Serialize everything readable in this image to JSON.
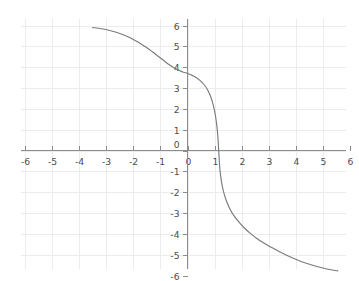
{
  "chart_data": {
    "type": "line",
    "title": "",
    "subtitle": "",
    "xlabel": "",
    "ylabel": "",
    "xlim": [
      -6,
      6
    ],
    "ylim": [
      -6,
      6
    ],
    "grid": true,
    "legend": false,
    "legend_position": "none",
    "x_ticks": [
      -6,
      -5,
      -4,
      -3,
      -2,
      -1,
      0,
      1,
      2,
      3,
      4,
      5,
      6
    ],
    "y_ticks": [
      -6,
      -5,
      -4,
      -3,
      -2,
      -1,
      0,
      1,
      2,
      3,
      4,
      5,
      6
    ],
    "x_tick_labels": [
      "-6",
      "-5",
      "-4",
      "-3",
      "-2",
      "-1",
      "0",
      "1",
      "2",
      "3",
      "4",
      "5",
      "6"
    ],
    "y_tick_labels": [
      "-6",
      "-5",
      "-4",
      "-3",
      "-2",
      "-1",
      "0",
      "1",
      "2",
      "3",
      "4",
      "5",
      "6"
    ],
    "annotations": [],
    "series": [
      {
        "name": "curve",
        "color": "#7a7a7a",
        "x_zero_crossing": 1.15,
        "y_at_x_zero": 3.7,
        "points": [
          [
            -3.5,
            5.9
          ],
          [
            -3.3,
            5.87
          ],
          [
            -3.1,
            5.83
          ],
          [
            -2.9,
            5.77
          ],
          [
            -2.7,
            5.7
          ],
          [
            -2.5,
            5.62
          ],
          [
            -2.3,
            5.52
          ],
          [
            -2.1,
            5.4
          ],
          [
            -1.9,
            5.26
          ],
          [
            -1.7,
            5.1
          ],
          [
            -1.5,
            4.93
          ],
          [
            -1.3,
            4.74
          ],
          [
            -1.1,
            4.54
          ],
          [
            -0.9,
            4.34
          ],
          [
            -0.7,
            4.14
          ],
          [
            -0.5,
            3.97
          ],
          [
            -0.3,
            3.84
          ],
          [
            -0.15,
            3.76
          ],
          [
            0.0,
            3.7
          ],
          [
            0.15,
            3.62
          ],
          [
            0.3,
            3.52
          ],
          [
            0.45,
            3.38
          ],
          [
            0.6,
            3.18
          ],
          [
            0.72,
            2.96
          ],
          [
            0.82,
            2.7
          ],
          [
            0.9,
            2.42
          ],
          [
            0.97,
            2.08
          ],
          [
            1.03,
            1.68
          ],
          [
            1.08,
            1.22
          ],
          [
            1.12,
            0.7
          ],
          [
            1.15,
            0.05
          ],
          [
            1.18,
            -0.62
          ],
          [
            1.22,
            -1.18
          ],
          [
            1.28,
            -1.68
          ],
          [
            1.36,
            -2.12
          ],
          [
            1.46,
            -2.5
          ],
          [
            1.58,
            -2.84
          ],
          [
            1.72,
            -3.14
          ],
          [
            1.9,
            -3.44
          ],
          [
            2.1,
            -3.72
          ],
          [
            2.32,
            -3.98
          ],
          [
            2.56,
            -4.22
          ],
          [
            2.82,
            -4.44
          ],
          [
            3.1,
            -4.65
          ],
          [
            3.4,
            -4.86
          ],
          [
            3.72,
            -5.06
          ],
          [
            4.04,
            -5.24
          ],
          [
            4.36,
            -5.4
          ],
          [
            4.68,
            -5.53
          ],
          [
            5.0,
            -5.64
          ],
          [
            5.2,
            -5.7
          ],
          [
            5.4,
            -5.75
          ],
          [
            5.55,
            -5.78
          ]
        ]
      }
    ],
    "colors": {
      "curve": "#7a7a7a",
      "axis": "#8c8c8c",
      "grid": "#ececec",
      "text": "#4d4d4d",
      "background": "#ffffff"
    }
  }
}
